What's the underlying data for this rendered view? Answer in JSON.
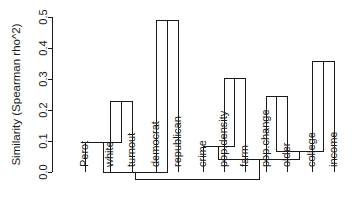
{
  "chart_data": {
    "type": "dendrogram",
    "title": "",
    "xlabel": "",
    "ylabel": "Similarity (Spearman rho^2)",
    "ylim": [
      0.0,
      0.5
    ],
    "yticks": [
      "0.0",
      "0.1",
      "0.2",
      "0.3",
      "0.4",
      "0.5"
    ],
    "ytick_values": [
      0.0,
      0.1,
      0.2,
      0.3,
      0.4,
      0.5
    ],
    "grid": false,
    "legend": false,
    "orientation": "vertical-rotated-labels",
    "leaves": [
      {
        "label": "Perot",
        "x": 85
      },
      {
        "label": "white",
        "x": 110
      },
      {
        "label": "turnout",
        "x": 132
      },
      {
        "label": "democrat",
        "x": 156
      },
      {
        "label": "republican",
        "x": 178
      },
      {
        "label": "crime",
        "x": 203
      },
      {
        "label": "pop.density",
        "x": 224
      },
      {
        "label": "farm",
        "x": 245
      },
      {
        "label": "pop.change",
        "x": 266
      },
      {
        "label": "older",
        "x": 287
      },
      {
        "label": "college",
        "x": 312
      },
      {
        "label": "income",
        "x": 334
      }
    ],
    "merges": [
      {
        "name": "democrat+republican",
        "left": 156,
        "right": 178,
        "height": 0.49,
        "left_height": 0.0,
        "right_height": 0.0
      },
      {
        "name": "college+income",
        "left": 312,
        "right": 334,
        "height": 0.355,
        "left_height": 0.0,
        "right_height": 0.0
      },
      {
        "name": "pop.density+farm",
        "left": 224,
        "right": 245,
        "height": 0.303,
        "left_height": 0.0,
        "right_height": 0.0
      },
      {
        "name": "pop.change+older",
        "left": 266,
        "right": 287,
        "height": 0.245,
        "left_height": 0.0,
        "right_height": 0.0
      },
      {
        "name": "white+turnout",
        "left": 110,
        "right": 132,
        "height": 0.226,
        "left_height": 0.0,
        "right_height": 0.0
      },
      {
        "name": "Perot+(white,turnout)",
        "left": 85,
        "right": 121,
        "height": 0.094,
        "left_height": 0.0,
        "right_height": 0.226
      },
      {
        "name": "crime+(pop.density,farm)",
        "left": 203,
        "right": 234.5,
        "height": 0.081,
        "left_height": 0.0,
        "right_height": 0.303
      },
      {
        "name": "(pop.change,older)+(college,income)",
        "left": 276.5,
        "right": 323,
        "height": 0.065,
        "left_height": 0.245,
        "right_height": 0.355
      },
      {
        "name": "right-inner",
        "left": 218.7,
        "right": 299.7,
        "height": 0.039,
        "left_height": 0.081,
        "right_height": 0.065
      },
      {
        "name": "left-cluster",
        "left": 103,
        "right": 167,
        "height": 0.0,
        "left_height": 0.094,
        "right_height": 0.49
      },
      {
        "name": "root",
        "left": 135,
        "right": 259.2,
        "height": -0.023,
        "left_height": 0.0,
        "right_height": 0.039
      }
    ],
    "leaf_tick_values": [
      {
        "label": "Perot",
        "value": 0.0
      },
      {
        "label": "white",
        "value": 0.0
      },
      {
        "label": "turnout",
        "value": 0.0
      },
      {
        "label": "democrat",
        "value": 0.0
      },
      {
        "label": "republican",
        "value": 0.0
      },
      {
        "label": "crime",
        "value": 0.0
      },
      {
        "label": "pop.density",
        "value": 0.0
      },
      {
        "label": "farm",
        "value": 0.0
      },
      {
        "label": "pop.change",
        "value": 0.0
      },
      {
        "label": "older",
        "value": 0.0
      },
      {
        "label": "college",
        "value": 0.0
      },
      {
        "label": "income",
        "value": 0.0
      }
    ]
  },
  "axis": {
    "title": "Similarity (Spearman rho^2)",
    "ticks": [
      "0.0",
      "0.1",
      "0.2",
      "0.3",
      "0.4",
      "0.5"
    ]
  },
  "colors": {
    "ink": "#1a1a1a",
    "background": "#ffffff"
  }
}
